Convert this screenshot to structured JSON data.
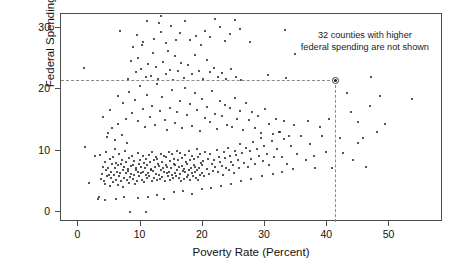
{
  "chart_data": {
    "type": "scatter",
    "title": "",
    "xlabel": "Poverty Rate (Percent)",
    "ylabel": "Federal Spending Per Capita",
    "xlim": [
      -2.8,
      58.6
    ],
    "ylim": [
      -1.6,
      32.2
    ],
    "xticks": [
      0,
      10,
      20,
      30,
      40,
      50
    ],
    "xtick_labels": [
      "0",
      "10",
      "20",
      "30",
      "40",
      "50"
    ],
    "yticks": [
      0,
      10,
      20,
      30
    ],
    "ytick_labels": [
      "0",
      "10",
      "20",
      "30"
    ],
    "grid": false,
    "legend": null,
    "marker": "filled-circle",
    "marker_color": "#1b1b1b",
    "frame_color": "#4d4d4d",
    "annotations": [
      {
        "name": "omitted-counties-note",
        "line1": "32 counties with higher",
        "line2": "federal spending are not shown"
      }
    ],
    "reference_lines": {
      "style": "dashed",
      "color": "#8a8a8a",
      "highlight_point": {
        "x": 41.3,
        "y": 21.4
      },
      "hline_y": 21.4,
      "vline_x": 41.3,
      "hline_x_range": [
        -2.8,
        41.3
      ],
      "vline_y_range": [
        -1.6,
        21.4
      ]
    },
    "points": [
      [
        0.9,
        23.4
      ],
      [
        1.1,
        10.6
      ],
      [
        1.7,
        4.8
      ],
      [
        2.6,
        9.1
      ],
      [
        3.4,
        9.3
      ],
      [
        3.1,
        2.2
      ],
      [
        3.3,
        2.4
      ],
      [
        3.6,
        5.4
      ],
      [
        3.8,
        6.2
      ],
      [
        3.9,
        7.4
      ],
      [
        4.1,
        5.1
      ],
      [
        4.2,
        8.2
      ],
      [
        4.3,
        4.6
      ],
      [
        4.4,
        6.8
      ],
      [
        4.5,
        9.7
      ],
      [
        4.6,
        5.8
      ],
      [
        4.7,
        7.1
      ],
      [
        4.8,
        12.8
      ],
      [
        4.9,
        6.0
      ],
      [
        5.0,
        8.6
      ],
      [
        5.1,
        4.2
      ],
      [
        5.2,
        6.5
      ],
      [
        5.3,
        5.5
      ],
      [
        5.4,
        7.8
      ],
      [
        5.5,
        9.0
      ],
      [
        5.6,
        4.9
      ],
      [
        5.7,
        6.1
      ],
      [
        5.8,
        10.2
      ],
      [
        5.9,
        7.2
      ],
      [
        6.0,
        5.3
      ],
      [
        6.1,
        8.0
      ],
      [
        6.2,
        6.6
      ],
      [
        6.3,
        4.4
      ],
      [
        6.4,
        7.6
      ],
      [
        6.5,
        5.9
      ],
      [
        6.6,
        9.4
      ],
      [
        6.7,
        6.3
      ],
      [
        6.8,
        7.9
      ],
      [
        6.9,
        5.0
      ],
      [
        7.0,
        8.4
      ],
      [
        7.1,
        6.9
      ],
      [
        7.2,
        4.1
      ],
      [
        7.3,
        7.3
      ],
      [
        7.4,
        5.6
      ],
      [
        7.5,
        9.9
      ],
      [
        7.6,
        6.4
      ],
      [
        7.7,
        8.1
      ],
      [
        7.8,
        5.2
      ],
      [
        7.9,
        7.0
      ],
      [
        8.0,
        6.7
      ],
      [
        8.1,
        4.7
      ],
      [
        8.2,
        8.8
      ],
      [
        8.3,
        5.7
      ],
      [
        8.4,
        7.5
      ],
      [
        8.5,
        6.2
      ],
      [
        8.6,
        9.2
      ],
      [
        8.7,
        5.4
      ],
      [
        8.8,
        7.7
      ],
      [
        8.9,
        6.0
      ],
      [
        9.0,
        8.3
      ],
      [
        9.1,
        4.5
      ],
      [
        9.2,
        6.8
      ],
      [
        9.3,
        7.1
      ],
      [
        9.4,
        5.1
      ],
      [
        9.5,
        9.6
      ],
      [
        9.6,
        6.5
      ],
      [
        9.7,
        7.9
      ],
      [
        9.8,
        5.8
      ],
      [
        9.9,
        8.5
      ],
      [
        10.0,
        6.3
      ],
      [
        10.1,
        7.4
      ],
      [
        10.2,
        5.3
      ],
      [
        10.3,
        9.1
      ],
      [
        10.4,
        6.6
      ],
      [
        10.5,
        8.0
      ],
      [
        10.6,
        4.9
      ],
      [
        10.7,
        7.2
      ],
      [
        10.8,
        6.1
      ],
      [
        10.9,
        8.7
      ],
      [
        11.0,
        5.5
      ],
      [
        11.1,
        7.6
      ],
      [
        11.2,
        6.4
      ],
      [
        11.3,
        9.3
      ],
      [
        11.4,
        5.9
      ],
      [
        11.5,
        8.2
      ],
      [
        11.6,
        6.9
      ],
      [
        11.7,
        7.0
      ],
      [
        11.8,
        5.0
      ],
      [
        11.9,
        9.8
      ],
      [
        12.0,
        6.7
      ],
      [
        12.1,
        8.4
      ],
      [
        12.2,
        5.6
      ],
      [
        12.3,
        7.3
      ],
      [
        12.4,
        6.2
      ],
      [
        12.5,
        9.0
      ],
      [
        12.6,
        5.2
      ],
      [
        12.7,
        8.6
      ],
      [
        12.8,
        7.8
      ],
      [
        12.9,
        6.0
      ],
      [
        13.0,
        7.5
      ],
      [
        13.1,
        5.4
      ],
      [
        13.2,
        9.5
      ],
      [
        13.3,
        6.8
      ],
      [
        13.4,
        8.1
      ],
      [
        13.5,
        5.7
      ],
      [
        13.6,
        7.1
      ],
      [
        13.7,
        6.5
      ],
      [
        13.8,
        9.2
      ],
      [
        13.9,
        5.1
      ],
      [
        14.0,
        8.9
      ],
      [
        14.1,
        7.7
      ],
      [
        14.2,
        6.3
      ],
      [
        14.3,
        7.4
      ],
      [
        14.4,
        5.8
      ],
      [
        14.5,
        9.7
      ],
      [
        14.6,
        6.6
      ],
      [
        14.7,
        8.3
      ],
      [
        14.8,
        5.3
      ],
      [
        14.9,
        7.2
      ],
      [
        15.0,
        6.1
      ],
      [
        15.1,
        9.4
      ],
      [
        15.2,
        5.5
      ],
      [
        15.3,
        8.7
      ],
      [
        15.4,
        7.9
      ],
      [
        15.5,
        6.4
      ],
      [
        15.6,
        7.6
      ],
      [
        15.7,
        5.9
      ],
      [
        15.8,
        10.0
      ],
      [
        15.9,
        6.9
      ],
      [
        16.0,
        8.5
      ],
      [
        16.1,
        5.6
      ],
      [
        16.2,
        7.3
      ],
      [
        16.3,
        6.2
      ],
      [
        16.4,
        9.6
      ],
      [
        16.5,
        5.0
      ],
      [
        16.6,
        8.8
      ],
      [
        16.7,
        7.5
      ],
      [
        16.8,
        6.7
      ],
      [
        16.9,
        7.0
      ],
      [
        17.0,
        5.4
      ],
      [
        17.1,
        9.3
      ],
      [
        17.2,
        6.5
      ],
      [
        17.3,
        8.2
      ],
      [
        17.4,
        5.7
      ],
      [
        17.5,
        7.8
      ],
      [
        17.6,
        6.0
      ],
      [
        17.7,
        9.9
      ],
      [
        17.8,
        6.8
      ],
      [
        17.9,
        8.4
      ],
      [
        18.0,
        5.2
      ],
      [
        18.1,
        7.1
      ],
      [
        18.2,
        6.3
      ],
      [
        18.3,
        9.1
      ],
      [
        18.4,
        5.8
      ],
      [
        18.5,
        8.6
      ],
      [
        18.6,
        7.7
      ],
      [
        18.7,
        6.6
      ],
      [
        18.8,
        7.4
      ],
      [
        18.9,
        5.5
      ],
      [
        19.0,
        10.2
      ],
      [
        19.1,
        6.9
      ],
      [
        19.2,
        8.9
      ],
      [
        19.3,
        5.3
      ],
      [
        19.4,
        7.2
      ],
      [
        19.5,
        6.1
      ],
      [
        19.6,
        9.5
      ],
      [
        19.7,
        8.0
      ],
      [
        19.8,
        7.6
      ],
      [
        19.9,
        6.4
      ],
      [
        20.0,
        8.3
      ],
      [
        20.2,
        5.9
      ],
      [
        20.4,
        9.8
      ],
      [
        20.6,
        7.0
      ],
      [
        20.8,
        8.7
      ],
      [
        21.0,
        6.2
      ],
      [
        21.2,
        9.4
      ],
      [
        21.4,
        7.9
      ],
      [
        21.6,
        6.7
      ],
      [
        21.8,
        8.5
      ],
      [
        22.0,
        7.3
      ],
      [
        22.2,
        10.1
      ],
      [
        22.4,
        6.5
      ],
      [
        22.6,
        9.0
      ],
      [
        22.8,
        8.2
      ],
      [
        23.0,
        7.5
      ],
      [
        23.2,
        6.0
      ],
      [
        23.4,
        9.7
      ],
      [
        23.6,
        8.8
      ],
      [
        23.8,
        7.1
      ],
      [
        24.0,
        10.4
      ],
      [
        24.2,
        6.8
      ],
      [
        24.4,
        9.2
      ],
      [
        24.6,
        8.1
      ],
      [
        24.8,
        7.7
      ],
      [
        25.0,
        6.3
      ],
      [
        25.2,
        10.0
      ],
      [
        25.4,
        9.3
      ],
      [
        25.6,
        8.4
      ],
      [
        25.8,
        7.2
      ],
      [
        26.0,
        11.1
      ],
      [
        26.3,
        9.6
      ],
      [
        26.6,
        8.0
      ],
      [
        26.9,
        10.5
      ],
      [
        27.2,
        7.4
      ],
      [
        27.5,
        9.9
      ],
      [
        27.8,
        8.6
      ],
      [
        28.1,
        11.4
      ],
      [
        28.4,
        7.8
      ],
      [
        28.7,
        10.2
      ],
      [
        29.0,
        9.1
      ],
      [
        29.3,
        12.0
      ],
      [
        29.6,
        8.3
      ],
      [
        29.9,
        10.8
      ],
      [
        30.3,
        9.4
      ],
      [
        30.7,
        7.6
      ],
      [
        31.1,
        11.6
      ],
      [
        31.5,
        8.9
      ],
      [
        31.9,
        10.3
      ],
      [
        32.3,
        13.1
      ],
      [
        32.7,
        9.0
      ],
      [
        33.1,
        11.9
      ],
      [
        33.6,
        7.9
      ],
      [
        34.1,
        10.7
      ],
      [
        34.6,
        14.2
      ],
      [
        35.2,
        9.5
      ],
      [
        35.8,
        12.3
      ],
      [
        36.5,
        8.4
      ],
      [
        37.2,
        11.0
      ],
      [
        38.0,
        7.1
      ],
      [
        38.9,
        13.8
      ],
      [
        39.8,
        9.8
      ],
      [
        40.8,
        7.2
      ],
      [
        41.3,
        21.4
      ],
      [
        42.0,
        12.0
      ],
      [
        43.2,
        19.4
      ],
      [
        44.1,
        8.4
      ],
      [
        45.0,
        14.6
      ],
      [
        45.8,
        12.1
      ],
      [
        46.2,
        7.3
      ],
      [
        47.0,
        21.9
      ],
      [
        48.4,
        18.8
      ],
      [
        49.2,
        14.3
      ],
      [
        53.6,
        18.4
      ],
      [
        8.3,
        0.1
      ],
      [
        10.8,
        0.1
      ],
      [
        4.3,
        2.0
      ],
      [
        6.1,
        2.2
      ],
      [
        7.4,
        2.4
      ],
      [
        9.6,
        2.3
      ],
      [
        11.2,
        2.5
      ],
      [
        12.6,
        2.8
      ],
      [
        13.8,
        2.1
      ],
      [
        15.4,
        3.2
      ],
      [
        16.8,
        3.5
      ],
      [
        18.2,
        3.0
      ],
      [
        19.8,
        3.8
      ],
      [
        21.3,
        4.0
      ],
      [
        22.9,
        4.3
      ],
      [
        24.5,
        4.6
      ],
      [
        26.1,
        5.0
      ],
      [
        27.8,
        5.4
      ],
      [
        29.5,
        5.8
      ],
      [
        31.2,
        6.2
      ],
      [
        32.8,
        6.6
      ],
      [
        34.5,
        7.0
      ],
      [
        5.4,
        13.6
      ],
      [
        6.3,
        14.4
      ],
      [
        7.1,
        17.7
      ],
      [
        7.6,
        15.2
      ],
      [
        8.2,
        19.6
      ],
      [
        8.6,
        16.1
      ],
      [
        9.1,
        18.2
      ],
      [
        9.5,
        14.8
      ],
      [
        9.9,
        20.5
      ],
      [
        10.3,
        16.8
      ],
      [
        10.7,
        13.9
      ],
      [
        11.1,
        19.1
      ],
      [
        11.5,
        15.5
      ],
      [
        11.9,
        17.3
      ],
      [
        12.3,
        14.1
      ],
      [
        12.7,
        20.9
      ],
      [
        13.1,
        16.4
      ],
      [
        13.5,
        18.7
      ],
      [
        13.9,
        15.0
      ],
      [
        14.3,
        13.4
      ],
      [
        14.7,
        17.0
      ],
      [
        15.1,
        19.9
      ],
      [
        15.5,
        14.5
      ],
      [
        15.9,
        16.2
      ],
      [
        16.3,
        18.0
      ],
      [
        16.7,
        13.7
      ],
      [
        17.1,
        20.1
      ],
      [
        17.5,
        15.8
      ],
      [
        17.9,
        17.5
      ],
      [
        18.3,
        14.0
      ],
      [
        18.7,
        19.3
      ],
      [
        19.1,
        16.6
      ],
      [
        19.5,
        13.2
      ],
      [
        19.9,
        18.4
      ],
      [
        20.3,
        15.3
      ],
      [
        20.7,
        17.1
      ],
      [
        21.1,
        14.7
      ],
      [
        21.5,
        19.7
      ],
      [
        21.9,
        16.0
      ],
      [
        22.3,
        13.5
      ],
      [
        22.7,
        18.1
      ],
      [
        23.1,
        15.6
      ],
      [
        23.5,
        17.4
      ],
      [
        23.9,
        14.2
      ],
      [
        24.3,
        16.9
      ],
      [
        24.7,
        13.8
      ],
      [
        25.1,
        18.5
      ],
      [
        25.5,
        15.1
      ],
      [
        25.9,
        16.5
      ],
      [
        26.4,
        13.3
      ],
      [
        26.9,
        17.8
      ],
      [
        27.4,
        14.9
      ],
      [
        27.9,
        16.3
      ],
      [
        28.4,
        13.6
      ],
      [
        28.9,
        15.7
      ],
      [
        29.4,
        12.9
      ],
      [
        30.0,
        16.7
      ],
      [
        30.6,
        14.4
      ],
      [
        31.2,
        12.7
      ],
      [
        31.8,
        15.2
      ],
      [
        32.4,
        13.1
      ],
      [
        33.0,
        14.8
      ],
      [
        33.8,
        12.4
      ],
      [
        7.9,
        21.6
      ],
      [
        8.4,
        24.6
      ],
      [
        8.8,
        26.9
      ],
      [
        9.2,
        22.8
      ],
      [
        9.6,
        25.1
      ],
      [
        10.0,
        23.3
      ],
      [
        10.4,
        27.6
      ],
      [
        10.8,
        21.9
      ],
      [
        11.2,
        24.0
      ],
      [
        11.6,
        22.2
      ],
      [
        12.0,
        25.8
      ],
      [
        12.4,
        23.6
      ],
      [
        12.8,
        21.7
      ],
      [
        13.2,
        29.3
      ],
      [
        13.6,
        24.4
      ],
      [
        14.0,
        22.5
      ],
      [
        14.4,
        26.2
      ],
      [
        14.8,
        23.1
      ],
      [
        15.2,
        21.5
      ],
      [
        15.6,
        25.4
      ],
      [
        16.0,
        22.9
      ],
      [
        16.5,
        24.2
      ],
      [
        17.0,
        21.8
      ],
      [
        17.6,
        23.9
      ],
      [
        18.2,
        22.4
      ],
      [
        18.8,
        25.6
      ],
      [
        19.4,
        23.0
      ],
      [
        20.0,
        21.6
      ],
      [
        20.6,
        24.8
      ],
      [
        21.2,
        22.7
      ],
      [
        21.8,
        23.4
      ],
      [
        22.4,
        21.9
      ],
      [
        23.0,
        22.6
      ],
      [
        23.8,
        21.7
      ],
      [
        24.6,
        23.2
      ],
      [
        25.4,
        22.0
      ],
      [
        26.2,
        21.5
      ],
      [
        30.5,
        22.3
      ],
      [
        33.4,
        21.8
      ],
      [
        34.8,
        25.7
      ],
      [
        6.7,
        29.4
      ],
      [
        9.4,
        28.8
      ],
      [
        10.2,
        27.2
      ],
      [
        11.0,
        31.1
      ],
      [
        12.1,
        28.2
      ],
      [
        12.9,
        30.7
      ],
      [
        13.3,
        31.8
      ],
      [
        14.1,
        27.5
      ],
      [
        14.9,
        30.2
      ],
      [
        15.7,
        28.0
      ],
      [
        16.4,
        29.1
      ],
      [
        17.2,
        31.0
      ],
      [
        18.0,
        27.9
      ],
      [
        18.9,
        28.6
      ],
      [
        19.7,
        27.1
      ],
      [
        20.4,
        29.5
      ],
      [
        21.1,
        28.4
      ],
      [
        22.0,
        31.4
      ],
      [
        22.8,
        30.1
      ],
      [
        23.6,
        27.8
      ],
      [
        24.4,
        28.9
      ],
      [
        25.2,
        31.2
      ],
      [
        26.0,
        29.8
      ],
      [
        27.5,
        27.6
      ],
      [
        33.2,
        29.6
      ],
      [
        3.9,
        15.4
      ],
      [
        4.6,
        12.2
      ],
      [
        5.1,
        16.6
      ],
      [
        5.8,
        11.8
      ],
      [
        6.4,
        18.9
      ],
      [
        7.0,
        12.6
      ],
      [
        7.8,
        11.2
      ],
      [
        36.9,
        14.8
      ],
      [
        37.8,
        9.2
      ],
      [
        39.1,
        12.4
      ],
      [
        40.2,
        15.1
      ],
      [
        42.6,
        9.6
      ],
      [
        43.8,
        16.2
      ],
      [
        44.9,
        11.2
      ],
      [
        46.8,
        17.2
      ],
      [
        48.0,
        13.0
      ]
    ]
  },
  "axes": {
    "xlabel": "Poverty Rate (Percent)",
    "ylabel": "Federal Spending Per Capita",
    "xtick_labels": [
      "0",
      "10",
      "20",
      "30",
      "40",
      "50"
    ],
    "ytick_labels": [
      "0",
      "10",
      "20",
      "30"
    ]
  },
  "note": {
    "line1": "32 counties with higher",
    "line2": "federal spending are not shown"
  }
}
